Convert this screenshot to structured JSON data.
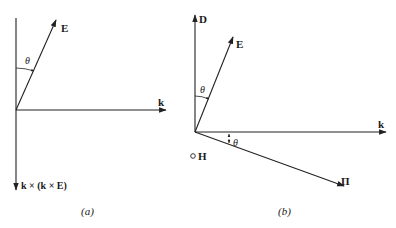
{
  "diagram": {
    "panels": [
      {
        "id": "a",
        "caption": "(a)",
        "vectors": [
          {
            "name": "E",
            "label": "E"
          },
          {
            "name": "k",
            "label": "k"
          },
          {
            "name": "k-cross-k-cross-E",
            "label": "k × (k × E)"
          }
        ],
        "angles": [
          {
            "label": "θ",
            "between": [
              "vertical axis",
              "E"
            ]
          }
        ]
      },
      {
        "id": "b",
        "caption": "(b)",
        "vectors": [
          {
            "name": "D",
            "label": "D"
          },
          {
            "name": "E",
            "label": "E"
          },
          {
            "name": "k",
            "label": "k"
          },
          {
            "name": "Pi",
            "label": "Π"
          }
        ],
        "out_of_plane": {
          "name": "H",
          "label": "H",
          "symbol": "○"
        },
        "angles": [
          {
            "label": "θ",
            "between": [
              "D",
              "E"
            ]
          },
          {
            "label": "θ",
            "between": [
              "k",
              "Π"
            ]
          }
        ]
      }
    ]
  },
  "labels": {
    "a_E": "E",
    "a_k": "k",
    "a_kkE": "k × (k × E)",
    "a_theta": "θ",
    "a_caption": "(a)",
    "b_D": "D",
    "b_E": "E",
    "b_k": "k",
    "b_Pi": "Π",
    "b_H": "H",
    "b_theta1": "θ",
    "b_theta2": "θ",
    "b_caption": "(b)"
  },
  "colors": {
    "ink": "#222222",
    "background": "#ffffff"
  }
}
